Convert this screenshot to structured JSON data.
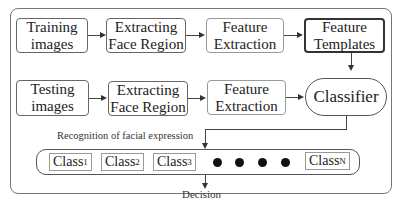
{
  "diagram": {
    "row1": [
      {
        "id": "training-images",
        "label": "Training images",
        "line1": "Training",
        "line2": "images"
      },
      {
        "id": "extracting-face-region-1",
        "label": "Extracting Face Region",
        "line1": "Extracting",
        "line2": "Face Region"
      },
      {
        "id": "feature-extraction-1",
        "label": "Feature Extraction",
        "line1": "Feature",
        "line2": "Extraction"
      },
      {
        "id": "feature-templates",
        "label": "Feature Templates",
        "line1": "Feature",
        "line2": "Templates"
      }
    ],
    "row2": [
      {
        "id": "testing-images",
        "label": "Testing images",
        "line1": "Testing",
        "line2": "images"
      },
      {
        "id": "extracting-face-region-2",
        "label": "Extracting Face Region",
        "line1": "Extracting",
        "line2": "Face Region"
      },
      {
        "id": "feature-extraction-2",
        "label": "Feature Extraction",
        "line1": "Feature",
        "line2": "Extraction"
      },
      {
        "id": "classifier",
        "label": "Classifier"
      }
    ],
    "recognition_label": "Recognition of facial expression",
    "classes": [
      {
        "base": "Class",
        "sub": "1"
      },
      {
        "base": "Class",
        "sub": "2"
      },
      {
        "base": "Class",
        "sub": "3"
      },
      {
        "base": "Class",
        "sub": "N"
      }
    ],
    "ellipsis_dots": 4,
    "decision_label": "Decision"
  }
}
